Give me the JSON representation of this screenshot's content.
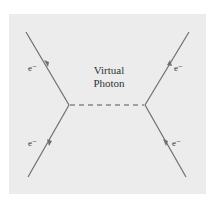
{
  "diagram": {
    "type": "feynman-diagram",
    "background_color": "#ececec",
    "line_color": "#6e6e6e",
    "propagator": {
      "label_line1": "Virtual",
      "label_line2": "Photon",
      "style": "dashed"
    },
    "particles": [
      {
        "id": "top-left",
        "label": "e⁻",
        "direction": "incoming"
      },
      {
        "id": "bottom-left",
        "label": "e⁻",
        "direction": "outgoing"
      },
      {
        "id": "top-right",
        "label": "e⁻",
        "direction": "incoming"
      },
      {
        "id": "bottom-right",
        "label": "e⁻",
        "direction": "outgoing"
      }
    ]
  }
}
